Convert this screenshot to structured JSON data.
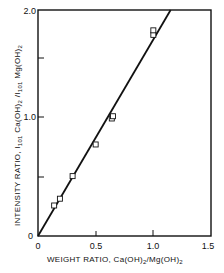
{
  "chart_data": {
    "type": "scatter",
    "title": "",
    "xlabel": "WEIGHT RATIO, Ca(OH)2/Mg(OH)2",
    "ylabel": "INTENSITY RATIO, I101 Ca(OH)2 / I101 Mg(OH)2",
    "xlim": [
      0,
      1.5
    ],
    "ylim": [
      0,
      2.0
    ],
    "x_ticks": [
      "0",
      "0.5",
      "1.0",
      "1.5"
    ],
    "y_ticks": [
      "0",
      "1.0",
      "2.0"
    ],
    "y_minor_ticks": [
      0.5,
      1.5
    ],
    "grid": false,
    "legend": null,
    "series": [
      {
        "name": "measured",
        "marker": "open-square",
        "x": [
          0.14,
          0.19,
          0.3,
          0.5,
          0.64,
          0.65,
          1.0,
          1.0
        ],
        "y": [
          0.27,
          0.33,
          0.53,
          0.81,
          1.04,
          1.06,
          1.78,
          1.82
        ]
      },
      {
        "name": "fit-line",
        "style": "solid-line",
        "x": [
          0,
          1.15
        ],
        "y": [
          0,
          2.0
        ]
      }
    ]
  },
  "labels": {
    "x_tick_0": "0",
    "x_tick_05": "0.5",
    "x_tick_10": "1.0",
    "x_tick_15": "1.5",
    "y_tick_0": "0",
    "y_tick_10": "1.0",
    "y_tick_20": "2.0",
    "xlabel_main": "WEIGHT RATIO, Ca(OH)",
    "xlabel_sub1": "2",
    "xlabel_mid": "/Mg(OH)",
    "xlabel_sub2": "2",
    "ylabel_a": "INTENSITY RATIO, I",
    "ylabel_sub_a": "101",
    "ylabel_b": " Ca(OH)",
    "ylabel_sub_b": "2",
    "ylabel_c": "  /I",
    "ylabel_sub_c": "101",
    "ylabel_d": " Mg(OH)",
    "ylabel_sub_d": "2"
  }
}
